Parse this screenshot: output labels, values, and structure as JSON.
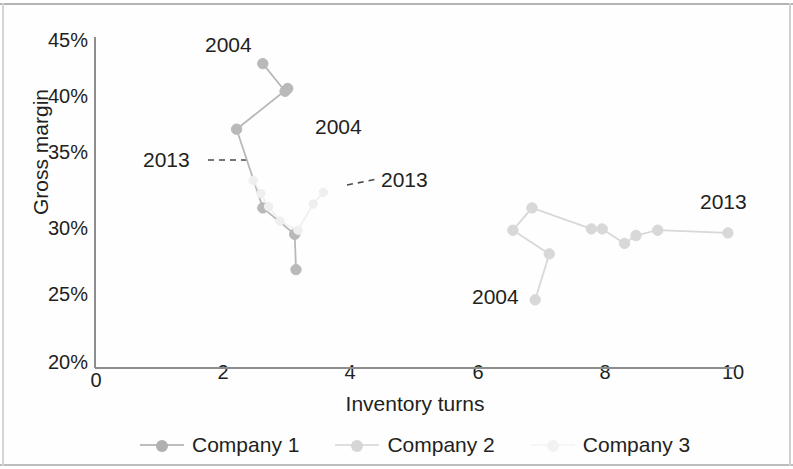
{
  "chart_data": {
    "type": "scatter",
    "title": "",
    "xlabel": "Inventory turns",
    "ylabel": "Gross margin",
    "xlim": [
      0,
      10
    ],
    "ylim": [
      20,
      45
    ],
    "xticks": [
      "0",
      "2",
      "4",
      "6",
      "8",
      "10"
    ],
    "xtick_values": [
      0,
      2,
      4,
      6,
      8,
      10
    ],
    "yticks": [
      "20%",
      "25%",
      "30%",
      "35%",
      "40%",
      "45%"
    ],
    "ytick_values": [
      20,
      25,
      30,
      35,
      40,
      45
    ],
    "grid": false,
    "legend_position": "bottom",
    "series": [
      {
        "name": "Company 1",
        "color": "#b9b9b9",
        "marker": "circle",
        "points": [
          {
            "x": 2.63,
            "y": 43.2,
            "label": "2004"
          },
          {
            "x": 2.98,
            "y": 41.1,
            "label": ""
          },
          {
            "x": 3.02,
            "y": 41.3,
            "label": ""
          },
          {
            "x": 2.22,
            "y": 38.2,
            "label": ""
          },
          {
            "x": 2.63,
            "y": 32.2,
            "label": ""
          },
          {
            "x": 3.13,
            "y": 30.2,
            "label": ""
          },
          {
            "x": 3.15,
            "y": 27.5,
            "label": "2013"
          }
        ]
      },
      {
        "name": "Company 2",
        "color": "#d8d8d8",
        "marker": "circle",
        "points": [
          {
            "x": 6.9,
            "y": 25.2,
            "label": "2004"
          },
          {
            "x": 7.12,
            "y": 28.7,
            "label": ""
          },
          {
            "x": 6.55,
            "y": 30.5,
            "label": ""
          },
          {
            "x": 6.85,
            "y": 32.2,
            "label": ""
          },
          {
            "x": 7.78,
            "y": 30.6,
            "label": ""
          },
          {
            "x": 7.95,
            "y": 30.6,
            "label": ""
          },
          {
            "x": 8.3,
            "y": 29.5,
            "label": ""
          },
          {
            "x": 8.48,
            "y": 30.1,
            "label": ""
          },
          {
            "x": 8.82,
            "y": 30.5,
            "label": ""
          },
          {
            "x": 9.92,
            "y": 30.3,
            "label": "2013"
          }
        ]
      },
      {
        "name": "Company 3",
        "color": "#efefef",
        "marker": "circle",
        "points": [
          {
            "x": 2.48,
            "y": 34.3,
            "label": "2013"
          },
          {
            "x": 2.6,
            "y": 33.3,
            "label": ""
          },
          {
            "x": 2.72,
            "y": 32.3,
            "label": ""
          },
          {
            "x": 2.9,
            "y": 31.2,
            "label": ""
          },
          {
            "x": 3.18,
            "y": 30.5,
            "label": ""
          },
          {
            "x": 3.42,
            "y": 32.5,
            "label": ""
          },
          {
            "x": 3.58,
            "y": 33.4,
            "label": "2004"
          }
        ]
      }
    ],
    "annotations": [
      {
        "text": "2004",
        "x_px": 205,
        "y_px": 35,
        "leader": false
      },
      {
        "text": "2013",
        "x_px": 143,
        "y_px": 148,
        "leader": true
      },
      {
        "text": "2004",
        "x_px": 315,
        "y_px": 115,
        "leader": false
      },
      {
        "text": "2013",
        "x_px": 381,
        "y_px": 168,
        "leader": true
      },
      {
        "text": "2004",
        "x_px": 472,
        "y_px": 285,
        "leader": false
      },
      {
        "text": "2013",
        "x_px": 700,
        "y_px": 190,
        "leader": false
      }
    ]
  },
  "legend": {
    "items": [
      {
        "label": "Company 1",
        "color": "#b9b9b9"
      },
      {
        "label": "Company 2",
        "color": "#d8d8d8"
      },
      {
        "label": "Company 3",
        "color": "#f2f2f2"
      }
    ]
  },
  "axes": {
    "x_title": "Inventory turns",
    "y_title": "Gross margin",
    "x_labels": [
      "0",
      "2",
      "4",
      "6",
      "8",
      "10"
    ],
    "y_labels": [
      "45%",
      "40%",
      "35%",
      "30%",
      "25%",
      "20%"
    ]
  }
}
